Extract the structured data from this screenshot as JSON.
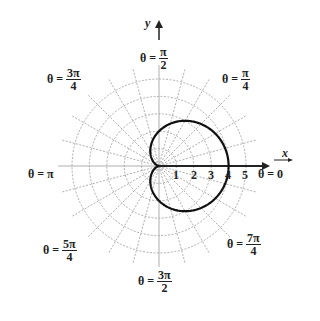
{
  "figure": {
    "axis_x_label": "x",
    "axis_y_label": "y",
    "ticks": [
      "1",
      "2",
      "3",
      "4",
      "5"
    ],
    "angle_labels": [
      {
        "id": "theta-0",
        "lhs": "θ = ",
        "value": "0"
      },
      {
        "id": "theta-pi-over-4",
        "lhs": "θ = ",
        "num": "π",
        "den": "4"
      },
      {
        "id": "theta-pi-over-2",
        "lhs": "θ = ",
        "num": "π",
        "den": "2"
      },
      {
        "id": "theta-3pi-over-4",
        "lhs": "θ = ",
        "num": "3π",
        "den": "4"
      },
      {
        "id": "theta-pi",
        "lhs": "θ = ",
        "value": "π"
      },
      {
        "id": "theta-5pi-over-4",
        "lhs": "θ = ",
        "num": "5π",
        "den": "4"
      },
      {
        "id": "theta-3pi-over-2",
        "lhs": "θ = ",
        "num": "3π",
        "den": "2"
      },
      {
        "id": "theta-7pi-over-4",
        "lhs": "θ = ",
        "num": "7π",
        "den": "4"
      }
    ],
    "curve": "cardioid r = 2 + 2cos(θ)",
    "grid": {
      "circle_radii": [
        1,
        2,
        3,
        4,
        5
      ],
      "radial_step_deg": 15
    },
    "colors": {
      "curve": "#111111",
      "grid": "#999999",
      "axis": "#222222"
    }
  }
}
